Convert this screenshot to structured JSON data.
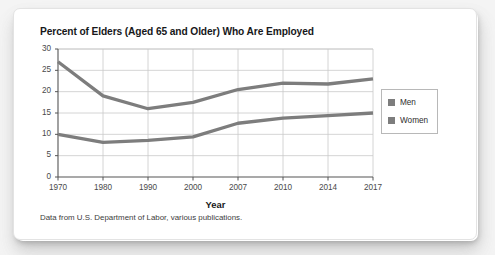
{
  "card": {
    "title": "Percent of Elders (Aged 65 and Older) Who Are Employed",
    "caption": "Data from U.S. Department of Labor, various publications."
  },
  "legend": {
    "position": "right",
    "items": [
      {
        "label": "Men",
        "color": "#7d7d7d"
      },
      {
        "label": "Women",
        "color": "#7d7d7d"
      }
    ]
  },
  "colors": {
    "line": "#7d7d7d",
    "grid": "#c9c9c9",
    "axis": "#555555",
    "text": "#17181a",
    "card_background": "#ffffff",
    "page_background": "#f4f4f4"
  },
  "chart_data": {
    "type": "line",
    "title": "Percent of Elders (Aged 65 and Older) Who Are Employed",
    "xlabel": "Year",
    "ylabel": "",
    "categories": [
      "1970",
      "1980",
      "1990",
      "2000",
      "2007",
      "2010",
      "2014",
      "2017"
    ],
    "ylim": [
      0,
      30
    ],
    "yticks": [
      0,
      5,
      10,
      15,
      20,
      25,
      30
    ],
    "grid": true,
    "legend_position": "right",
    "series": [
      {
        "name": "Men",
        "values": [
          27.0,
          19.0,
          16.0,
          17.5,
          20.5,
          22.0,
          21.8,
          23.0
        ]
      },
      {
        "name": "Women",
        "values": [
          10.0,
          8.1,
          8.6,
          9.4,
          12.6,
          13.8,
          14.4,
          15.0
        ]
      }
    ],
    "annotation": "Data from U.S. Department of Labor, various publications."
  }
}
